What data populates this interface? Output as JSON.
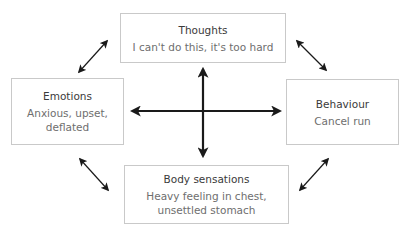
{
  "diagram": {
    "nodes": [
      {
        "id": "thoughts",
        "title": "Thoughts",
        "description": "I can't do this, it's too hard"
      },
      {
        "id": "emotions",
        "title": "Emotions",
        "description": "Anxious, upset, deflated"
      },
      {
        "id": "behaviour",
        "title": "Behaviour",
        "description": "Cancel run"
      },
      {
        "id": "body",
        "title": "Body sensations",
        "description": "Heavy feeling in chest, unsettled stomach"
      }
    ],
    "edges": [
      {
        "from": "thoughts",
        "to": "emotions",
        "type": "bidirectional"
      },
      {
        "from": "thoughts",
        "to": "behaviour",
        "type": "bidirectional"
      },
      {
        "from": "emotions",
        "to": "body",
        "type": "bidirectional"
      },
      {
        "from": "behaviour",
        "to": "body",
        "type": "bidirectional"
      },
      {
        "from": "thoughts",
        "to": "body",
        "type": "bidirectional"
      },
      {
        "from": "emotions",
        "to": "behaviour",
        "type": "bidirectional"
      }
    ],
    "colors": {
      "border": "#c9c9c9",
      "arrow": "#1a1a1a",
      "title_text": "#3a3a3a",
      "desc_text": "#6e6e6e"
    }
  }
}
